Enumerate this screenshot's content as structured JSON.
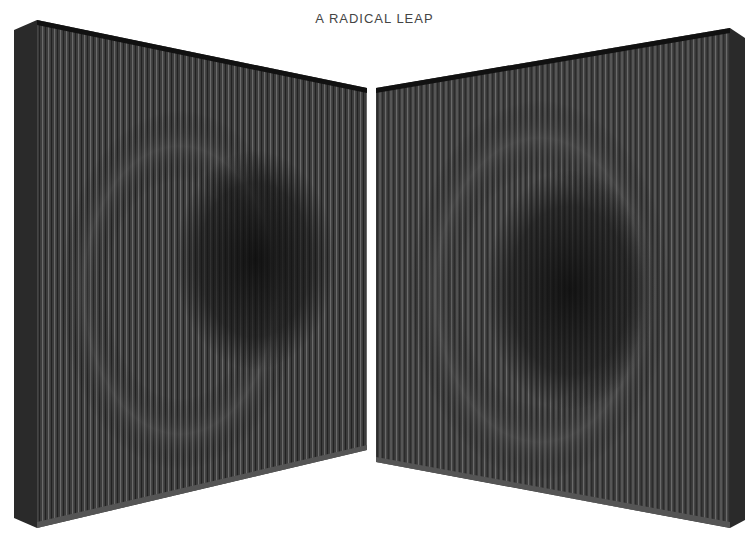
{
  "title": "A RADICAL LEAP",
  "artwork": {
    "panels": [
      {
        "name": "left-panel",
        "side_color": "#2b2b2b",
        "face_color": "#3a3a3a",
        "blob_color": "#151515"
      },
      {
        "name": "right-panel",
        "side_color": "#2b2b2b",
        "face_color": "#3b3b3b",
        "blob_color": "#141414"
      }
    ],
    "background": "#ffffff"
  }
}
